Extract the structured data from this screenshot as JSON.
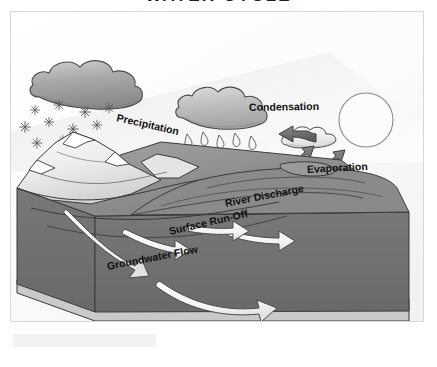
{
  "title": "WATER CYCLE",
  "diagram": {
    "type": "water-cycle-block-diagram",
    "labels": {
      "precipitation": "Precipitation",
      "condensation": "Condensation",
      "evaporation": "Evaporation",
      "river_discharge": "River Discharge",
      "surface_runoff": "Surface Run-Off",
      "groundwater_flow": "Groundwater Flow"
    },
    "elements": [
      {
        "name": "snow-cloud",
        "kind": "cloud",
        "shade": "dark"
      },
      {
        "name": "rain-cloud",
        "kind": "cloud",
        "shade": "medium"
      },
      {
        "name": "small-cloud",
        "kind": "cloud",
        "shade": "light"
      },
      {
        "name": "sun",
        "kind": "circle-outline"
      },
      {
        "name": "snowflakes",
        "kind": "precipitation",
        "form": "snow",
        "count": 11
      },
      {
        "name": "raindrops",
        "kind": "precipitation",
        "form": "rain",
        "count": 12
      },
      {
        "name": "mountains",
        "kind": "terrain",
        "form": "snow-capped-peaks"
      },
      {
        "name": "land-block",
        "kind": "3d-block"
      },
      {
        "name": "ocean",
        "kind": "water-body"
      },
      {
        "name": "evaporation-arrows",
        "kind": "arrow",
        "shade": "dark",
        "count": 4
      },
      {
        "name": "condensation-arrow",
        "kind": "arrow",
        "shade": "dark",
        "count": 1
      },
      {
        "name": "flow-arrows",
        "kind": "arrow",
        "shade": "white",
        "count": 4
      }
    ],
    "colors": {
      "land_top": "#8f8f8f",
      "land_side": "#6e6e6e",
      "land_base": "#c9c9c9",
      "mountain_light": "#e9e9e9",
      "cloud_dark": "#9a9a9a",
      "cloud_light": "#e2e2e2",
      "arrow_dark": "#6d6d6d",
      "arrow_white": "#ffffff",
      "outline": "#3a3a3a",
      "frame": "#d8d8d8",
      "label_text": "#101010"
    }
  }
}
